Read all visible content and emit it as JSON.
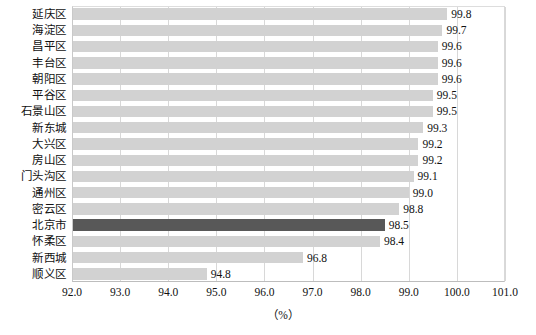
{
  "chart_data": {
    "type": "bar",
    "orientation": "horizontal",
    "title": "",
    "subtitle": "",
    "xlabel": "（%）",
    "ylabel": "",
    "xlim": [
      92.0,
      101.0
    ],
    "xticks": [
      "92.0",
      "93.0",
      "94.0",
      "95.0",
      "96.0",
      "97.0",
      "98.0",
      "99.0",
      "100.0",
      "101.0"
    ],
    "xtick_values": [
      92.0,
      93.0,
      94.0,
      95.0,
      96.0,
      97.0,
      98.0,
      99.0,
      100.0,
      101.0
    ],
    "grid": "vertical",
    "legend": "none",
    "categories": [
      "延庆区",
      "海淀区",
      "昌平区",
      "丰台区",
      "朝阳区",
      "平谷区",
      "石景山区",
      "新东城",
      "大兴区",
      "房山区",
      "门头沟区",
      "通州区",
      "密云区",
      "北京市",
      "怀柔区",
      "新西城",
      "顺义区"
    ],
    "values": [
      99.8,
      99.7,
      99.6,
      99.6,
      99.6,
      99.5,
      99.5,
      99.3,
      99.2,
      99.2,
      99.1,
      99.0,
      98.8,
      98.5,
      98.4,
      96.8,
      94.8
    ],
    "data_labels": [
      "99.8",
      "99.7",
      "99.6",
      "99.6",
      "99.6",
      "99.5",
      "99.5",
      "99.3",
      "99.2",
      "99.2",
      "99.1",
      "99.0",
      "98.8",
      "98.5",
      "98.4",
      "96.8",
      "94.8"
    ],
    "highlight_category": "北京市",
    "highlight_index": 13,
    "colors": {
      "bar": "#d2d2d2",
      "highlight_bar": "#585858",
      "gridline": "#d8d8d8",
      "axis": "#bdbdbd",
      "text": "#111111"
    }
  }
}
